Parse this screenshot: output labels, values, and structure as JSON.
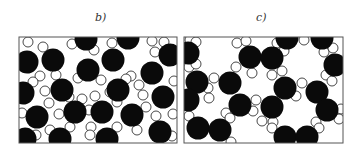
{
  "figure": {
    "panels": [
      {
        "id": "b",
        "label": "b)",
        "label_pos": [
          95,
          11
        ],
        "frame": {
          "x": 19,
          "y": 37,
          "w": 158,
          "h": 106
        },
        "black_r": 11.5,
        "white_r": 5,
        "black": [
          [
            27,
            62
          ],
          [
            53,
            60
          ],
          [
            86,
            39
          ],
          [
            88,
            70
          ],
          [
            113,
            60
          ],
          [
            128,
            38
          ],
          [
            170,
            55
          ],
          [
            152,
            73
          ],
          [
            23,
            93
          ],
          [
            62,
            90
          ],
          [
            118,
            90
          ],
          [
            163,
            97
          ],
          [
            37,
            117
          ],
          [
            75,
            112
          ],
          [
            102,
            112
          ],
          [
            132,
            115
          ],
          [
            25,
            139
          ],
          [
            60,
            139
          ],
          [
            107,
            139
          ],
          [
            160,
            132
          ]
        ],
        "white": [
          [
            28,
            42
          ],
          [
            43,
            47
          ],
          [
            72,
            44
          ],
          [
            94,
            50
          ],
          [
            112,
            43
          ],
          [
            152,
            41
          ],
          [
            164,
            42
          ],
          [
            40,
            76
          ],
          [
            56,
            75
          ],
          [
            78,
            78
          ],
          [
            101,
            80
          ],
          [
            131,
            76
          ],
          [
            139,
            85
          ],
          [
            155,
            52
          ],
          [
            69,
            97
          ],
          [
            82,
            99
          ],
          [
            95,
            96
          ],
          [
            110,
            92
          ],
          [
            126,
            79
          ],
          [
            143,
            95
          ],
          [
            174,
            81
          ],
          [
            22,
            113
          ],
          [
            49,
            103
          ],
          [
            59,
            114
          ],
          [
            89,
            110
          ],
          [
            117,
            102
          ],
          [
            146,
            107
          ],
          [
            156,
            116
          ],
          [
            173,
            114
          ],
          [
            91,
            127
          ],
          [
            50,
            130
          ],
          [
            36,
            135
          ],
          [
            70,
            127
          ],
          [
            90,
            135
          ],
          [
            117,
            127
          ],
          [
            137,
            130
          ],
          [
            172,
            136
          ],
          [
            45,
            91
          ],
          [
            33,
            82
          ]
        ]
      },
      {
        "id": "c",
        "label": "c)",
        "label_pos": [
          256,
          11
        ],
        "frame": {
          "x": 184,
          "y": 37,
          "w": 159,
          "h": 106
        },
        "black_r": 11.5,
        "white_r": 5,
        "black": [
          [
            188,
            53
          ],
          [
            250,
            57
          ],
          [
            272,
            58
          ],
          [
            287,
            38
          ],
          [
            322,
            38
          ],
          [
            335,
            65
          ],
          [
            197,
            82
          ],
          [
            230,
            83
          ],
          [
            285,
            88
          ],
          [
            317,
            92
          ],
          [
            188,
            100
          ],
          [
            240,
            105
          ],
          [
            272,
            107
          ],
          [
            327,
            110
          ],
          [
            198,
            128
          ],
          [
            220,
            130
          ],
          [
            285,
            137
          ],
          [
            307,
            137
          ]
        ],
        "white": [
          [
            190,
            40
          ],
          [
            196,
            42
          ],
          [
            237,
            43
          ],
          [
            246,
            41
          ],
          [
            277,
            43
          ],
          [
            284,
            51
          ],
          [
            304,
            40
          ],
          [
            324,
            52
          ],
          [
            333,
            48
          ],
          [
            189,
            67
          ],
          [
            196,
            64
          ],
          [
            236,
            67
          ],
          [
            252,
            73
          ],
          [
            272,
            75
          ],
          [
            282,
            71
          ],
          [
            326,
            75
          ],
          [
            332,
            81
          ],
          [
            214,
            78
          ],
          [
            208,
            88
          ],
          [
            209,
            98
          ],
          [
            302,
            83
          ],
          [
            296,
            96
          ],
          [
            256,
            100
          ],
          [
            253,
            111
          ],
          [
            226,
            113
          ],
          [
            230,
            118
          ],
          [
            189,
            116
          ],
          [
            262,
            121
          ],
          [
            316,
            122
          ],
          [
            319,
            128
          ],
          [
            341,
            109
          ],
          [
            339,
            119
          ],
          [
            273,
            122
          ],
          [
            272,
            128
          ],
          [
            231,
            142
          ],
          [
            193,
            103
          ]
        ]
      }
    ],
    "colors": {
      "black_fill": "#0a0a0a",
      "white_fill": "#ffffff",
      "stroke": "#1a1a1a",
      "frame": "#555555"
    }
  }
}
